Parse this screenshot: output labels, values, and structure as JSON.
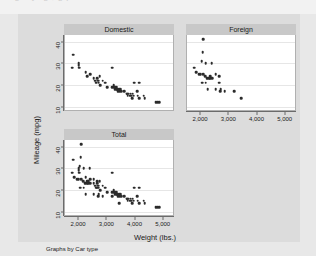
{
  "top_strip": {
    "ghost_text": "o   g  + y-  g ,  g p"
  },
  "colors": {
    "canvas_bg": "#dcdcdc",
    "page_bg": "#e8e8e8",
    "plot_bg": "#ffffff",
    "panel_header_bg": "#c8c8c8",
    "marker": "#2b2b2b",
    "gridline": "#e6e6e6",
    "axis": "#6b6b6b"
  },
  "note": "Graphs by Car type",
  "chart_data": {
    "type": "scatter",
    "title": "",
    "xlabel": "Weight (lbs.)",
    "ylabel": "Mileage (mpg)",
    "xlim": [
      1500,
      5400
    ],
    "ylim": [
      8,
      43
    ],
    "xticks": [
      2000,
      3000,
      4000,
      5000
    ],
    "xticklabels": [
      "2,000",
      "3,000",
      "4,000",
      "5,000"
    ],
    "yticks": [
      10,
      20,
      30,
      40
    ],
    "yticklabels": [
      "10",
      "20",
      "30",
      "40"
    ],
    "grid": true,
    "legend": "none",
    "by_variable": "Car type",
    "panels": [
      {
        "label": "Domestic",
        "position": "top-left",
        "show_xticklabels": false,
        "show_yticklabels": true,
        "points": [
          [
            1800,
            34
          ],
          [
            1760,
            28
          ],
          [
            1980,
            29
          ],
          [
            1990,
            30
          ],
          [
            2000,
            28
          ],
          [
            2230,
            26
          ],
          [
            2280,
            24
          ],
          [
            2400,
            25
          ],
          [
            2520,
            23
          ],
          [
            2580,
            22
          ],
          [
            2600,
            21
          ],
          [
            2650,
            23
          ],
          [
            2670,
            22
          ],
          [
            2690,
            21
          ],
          [
            2730,
            24
          ],
          [
            2750,
            20
          ],
          [
            2830,
            22
          ],
          [
            2930,
            21
          ],
          [
            3000,
            19
          ],
          [
            3180,
            28
          ],
          [
            3170,
            19
          ],
          [
            3220,
            20
          ],
          [
            3250,
            19
          ],
          [
            3260,
            18
          ],
          [
            3280,
            19
          ],
          [
            3310,
            18
          ],
          [
            3330,
            19
          ],
          [
            3350,
            18
          ],
          [
            3370,
            17
          ],
          [
            3420,
            18
          ],
          [
            3430,
            17
          ],
          [
            3470,
            18
          ],
          [
            3500,
            17
          ],
          [
            3600,
            17
          ],
          [
            3690,
            16
          ],
          [
            3700,
            16
          ],
          [
            3730,
            15
          ],
          [
            3740,
            16
          ],
          [
            3800,
            15
          ],
          [
            3830,
            16
          ],
          [
            3850,
            15
          ],
          [
            3880,
            14
          ],
          [
            3900,
            16
          ],
          [
            3940,
            15
          ],
          [
            3960,
            21
          ],
          [
            4060,
            17
          ],
          [
            4080,
            15
          ],
          [
            4130,
            14
          ],
          [
            4130,
            21
          ],
          [
            4330,
            14
          ],
          [
            4290,
            15
          ],
          [
            4720,
            12
          ],
          [
            4760,
            12
          ],
          [
            4840,
            12
          ]
        ]
      },
      {
        "label": "Foreign",
        "position": "top-right",
        "show_xticklabels": true,
        "show_yticklabels": false,
        "points": [
          [
            2070,
            41
          ],
          [
            2050,
            35
          ],
          [
            2020,
            31
          ],
          [
            2160,
            30
          ],
          [
            2370,
            30
          ],
          [
            1760,
            28
          ],
          [
            1830,
            26
          ],
          [
            1930,
            25
          ],
          [
            1990,
            25
          ],
          [
            2070,
            25
          ],
          [
            2140,
            24
          ],
          [
            2200,
            23
          ],
          [
            2230,
            23
          ],
          [
            2280,
            23
          ],
          [
            2330,
            23
          ],
          [
            2330,
            24
          ],
          [
            2400,
            23
          ],
          [
            2520,
            25
          ],
          [
            2650,
            24
          ],
          [
            2040,
            21
          ],
          [
            2160,
            21
          ],
          [
            2240,
            18
          ],
          [
            2520,
            18
          ],
          [
            2650,
            21
          ],
          [
            2690,
            18
          ],
          [
            2670,
            17
          ],
          [
            2830,
            17
          ],
          [
            3170,
            17
          ],
          [
            3420,
            14
          ]
        ]
      },
      {
        "label": "Total",
        "position": "bottom-left",
        "show_xticklabels": true,
        "show_yticklabels": true,
        "points": [
          [
            2070,
            41
          ],
          [
            1800,
            34
          ],
          [
            2050,
            35
          ],
          [
            2020,
            31
          ],
          [
            1760,
            28
          ],
          [
            1830,
            26
          ],
          [
            1930,
            25
          ],
          [
            1980,
            29
          ],
          [
            1990,
            30
          ],
          [
            2000,
            28
          ],
          [
            2160,
            30
          ],
          [
            2370,
            30
          ],
          [
            1990,
            25
          ],
          [
            2070,
            25
          ],
          [
            2140,
            24
          ],
          [
            2200,
            23
          ],
          [
            2230,
            26
          ],
          [
            2230,
            23
          ],
          [
            2280,
            24
          ],
          [
            2280,
            23
          ],
          [
            2330,
            23
          ],
          [
            2330,
            24
          ],
          [
            2400,
            25
          ],
          [
            2400,
            23
          ],
          [
            2520,
            25
          ],
          [
            2520,
            23
          ],
          [
            2580,
            22
          ],
          [
            2600,
            21
          ],
          [
            2650,
            24
          ],
          [
            2650,
            23
          ],
          [
            2650,
            21
          ],
          [
            2670,
            22
          ],
          [
            2670,
            17
          ],
          [
            2690,
            21
          ],
          [
            2690,
            18
          ],
          [
            2730,
            24
          ],
          [
            2750,
            20
          ],
          [
            2830,
            22
          ],
          [
            2830,
            17
          ],
          [
            2930,
            21
          ],
          [
            3000,
            19
          ],
          [
            3170,
            17
          ],
          [
            3180,
            28
          ],
          [
            3170,
            19
          ],
          [
            3220,
            20
          ],
          [
            3250,
            19
          ],
          [
            3260,
            18
          ],
          [
            3280,
            19
          ],
          [
            3310,
            18
          ],
          [
            3330,
            19
          ],
          [
            3350,
            18
          ],
          [
            3370,
            17
          ],
          [
            3420,
            18
          ],
          [
            3420,
            14
          ],
          [
            3430,
            17
          ],
          [
            3470,
            18
          ],
          [
            3500,
            17
          ],
          [
            3600,
            17
          ],
          [
            3690,
            16
          ],
          [
            3700,
            16
          ],
          [
            3730,
            15
          ],
          [
            3740,
            16
          ],
          [
            3800,
            15
          ],
          [
            3830,
            16
          ],
          [
            3850,
            15
          ],
          [
            3880,
            14
          ],
          [
            3900,
            16
          ],
          [
            3940,
            15
          ],
          [
            3960,
            21
          ],
          [
            4060,
            17
          ],
          [
            4080,
            15
          ],
          [
            4130,
            14
          ],
          [
            4130,
            21
          ],
          [
            4290,
            15
          ],
          [
            4330,
            14
          ],
          [
            4720,
            12
          ],
          [
            4760,
            12
          ],
          [
            4840,
            12
          ],
          [
            2040,
            21
          ],
          [
            2160,
            21
          ],
          [
            2240,
            18
          ],
          [
            2520,
            18
          ]
        ]
      }
    ]
  }
}
